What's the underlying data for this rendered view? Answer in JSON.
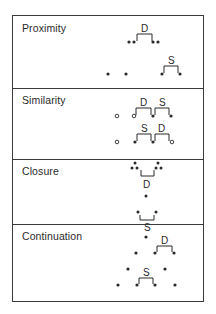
{
  "figure": {
    "panels": [
      {
        "title": "Proximity",
        "labels": {
          "top": "D",
          "bottom": "S"
        }
      },
      {
        "title": "Similarity",
        "labels": {
          "top_left": "D",
          "top_right": "S",
          "bottom_left": "S",
          "bottom_right": "D"
        }
      },
      {
        "title": "Closure",
        "labels": {
          "top": "D",
          "bottom": "S"
        }
      },
      {
        "title": "Continuation",
        "labels": {
          "top": "D",
          "bottom": "S"
        }
      }
    ],
    "legend": {
      "D": "different",
      "S": "same"
    },
    "colors": {
      "ink": "#2a2a2a",
      "frame": "#3a3a3a",
      "background": "#ffffff"
    }
  }
}
